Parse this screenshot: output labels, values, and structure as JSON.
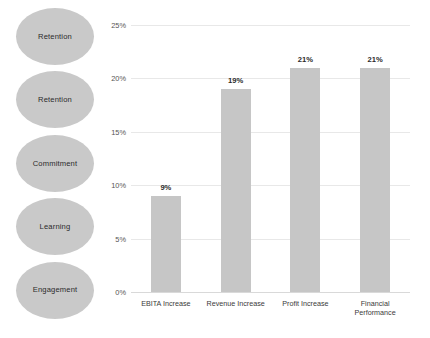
{
  "diagram": {
    "name": "engagement-outcomes-diagram",
    "ellipses": [
      {
        "label": "Retention"
      },
      {
        "label": "Retention"
      },
      {
        "label": "Commitment"
      },
      {
        "label": "Learning"
      },
      {
        "label": "Engagement"
      }
    ],
    "ellipse_color": "#c9c9c9"
  },
  "chart_data": {
    "type": "bar",
    "title": "",
    "subtitle": "",
    "xlabel": "",
    "ylabel": "",
    "categories": [
      "EBITA Increase",
      "Revenue Increase",
      "Profit Increase",
      "Financial\nPerformance"
    ],
    "values": [
      9,
      19,
      21,
      21
    ],
    "data_labels": [
      "9%",
      "19%",
      "21%",
      "21%"
    ],
    "ylim": [
      0,
      25
    ],
    "yticks": [
      0,
      5,
      10,
      15,
      20,
      25
    ],
    "ytick_labels": [
      "0%",
      "5%",
      "10%",
      "15%",
      "20%",
      "25%"
    ],
    "grid": true,
    "legend": false,
    "bar_color": "#c6c6c6",
    "gridline_color": "#e8e8e8"
  }
}
